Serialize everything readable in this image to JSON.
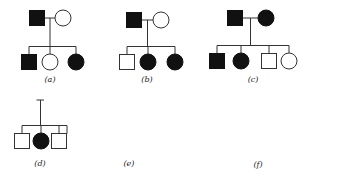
{
  "legend": {
    "square": "male",
    "circle": "female",
    "filled": "affected",
    "open": "unaffected"
  },
  "colors": {
    "affected": "#111111",
    "unaffected": "#ffffff",
    "line": "#333333"
  },
  "pedigrees": [
    {
      "id": "a",
      "label": "(a)",
      "parents": [
        {
          "sex": "male",
          "affected": true
        },
        {
          "sex": "female",
          "affected": false
        }
      ],
      "children": [
        {
          "sex": "male",
          "affected": true
        },
        {
          "sex": "female",
          "affected": false
        },
        {
          "sex": "female",
          "affected": true
        }
      ]
    },
    {
      "id": "b",
      "label": "(b)",
      "parents": [
        {
          "sex": "male",
          "affected": true
        },
        {
          "sex": "female",
          "affected": false
        }
      ],
      "children": [
        {
          "sex": "male",
          "affected": false
        },
        {
          "sex": "female",
          "affected": true
        },
        {
          "sex": "female",
          "affected": true
        }
      ]
    },
    {
      "id": "c",
      "label": "(c)",
      "parents": [
        {
          "sex": "male",
          "affected": true
        },
        {
          "sex": "female",
          "affected": true
        }
      ],
      "children": [
        {
          "sex": "male",
          "affected": true
        },
        {
          "sex": "female",
          "affected": true
        },
        {
          "sex": "male",
          "affected": false
        },
        {
          "sex": "female",
          "affected": false
        }
      ]
    },
    {
      "id": "d",
      "label": "(d)",
      "parents": [
        {
          "sex": "male",
          "affected": false
        },
        {
          "sex": "female",
          "affected": false
        }
      ],
      "children": [
        {
          "sex": "male",
          "affected": false
        },
        {
          "sex": "female",
          "affected": true
        },
        {
          "sex": "male",
          "affected": false
        }
      ]
    },
    {
      "id": "e",
      "label": "(e)",
      "parents": [
        {
          "sex": "male",
          "affected": false
        },
        {
          "sex": "female",
          "affected": false
        }
      ],
      "mother_sibling": {
        "sex": "male",
        "affected": true
      },
      "children": [
        {
          "sex": "male",
          "affected": true
        },
        {
          "sex": "female",
          "affected": false
        },
        {
          "sex": "male",
          "affected": false
        },
        {
          "sex": "female",
          "affected": false
        }
      ]
    },
    {
      "id": "f",
      "label": "(f)",
      "parents": [
        {
          "sex": "male",
          "affected": false,
          "role": "first husband"
        },
        {
          "sex": "female",
          "affected": false,
          "role": "mother"
        },
        {
          "sex": "male",
          "affected": false,
          "role": "second husband"
        }
      ],
      "children_first_marriage": [
        {
          "sex": "male",
          "affected": true
        },
        {
          "sex": "male",
          "affected": false
        },
        {
          "sex": "female",
          "affected": false
        }
      ],
      "children_second_marriage": [
        {
          "sex": "male",
          "affected": false
        },
        {
          "sex": "male",
          "affected": true
        },
        {
          "sex": "female",
          "affected": false
        }
      ]
    }
  ]
}
